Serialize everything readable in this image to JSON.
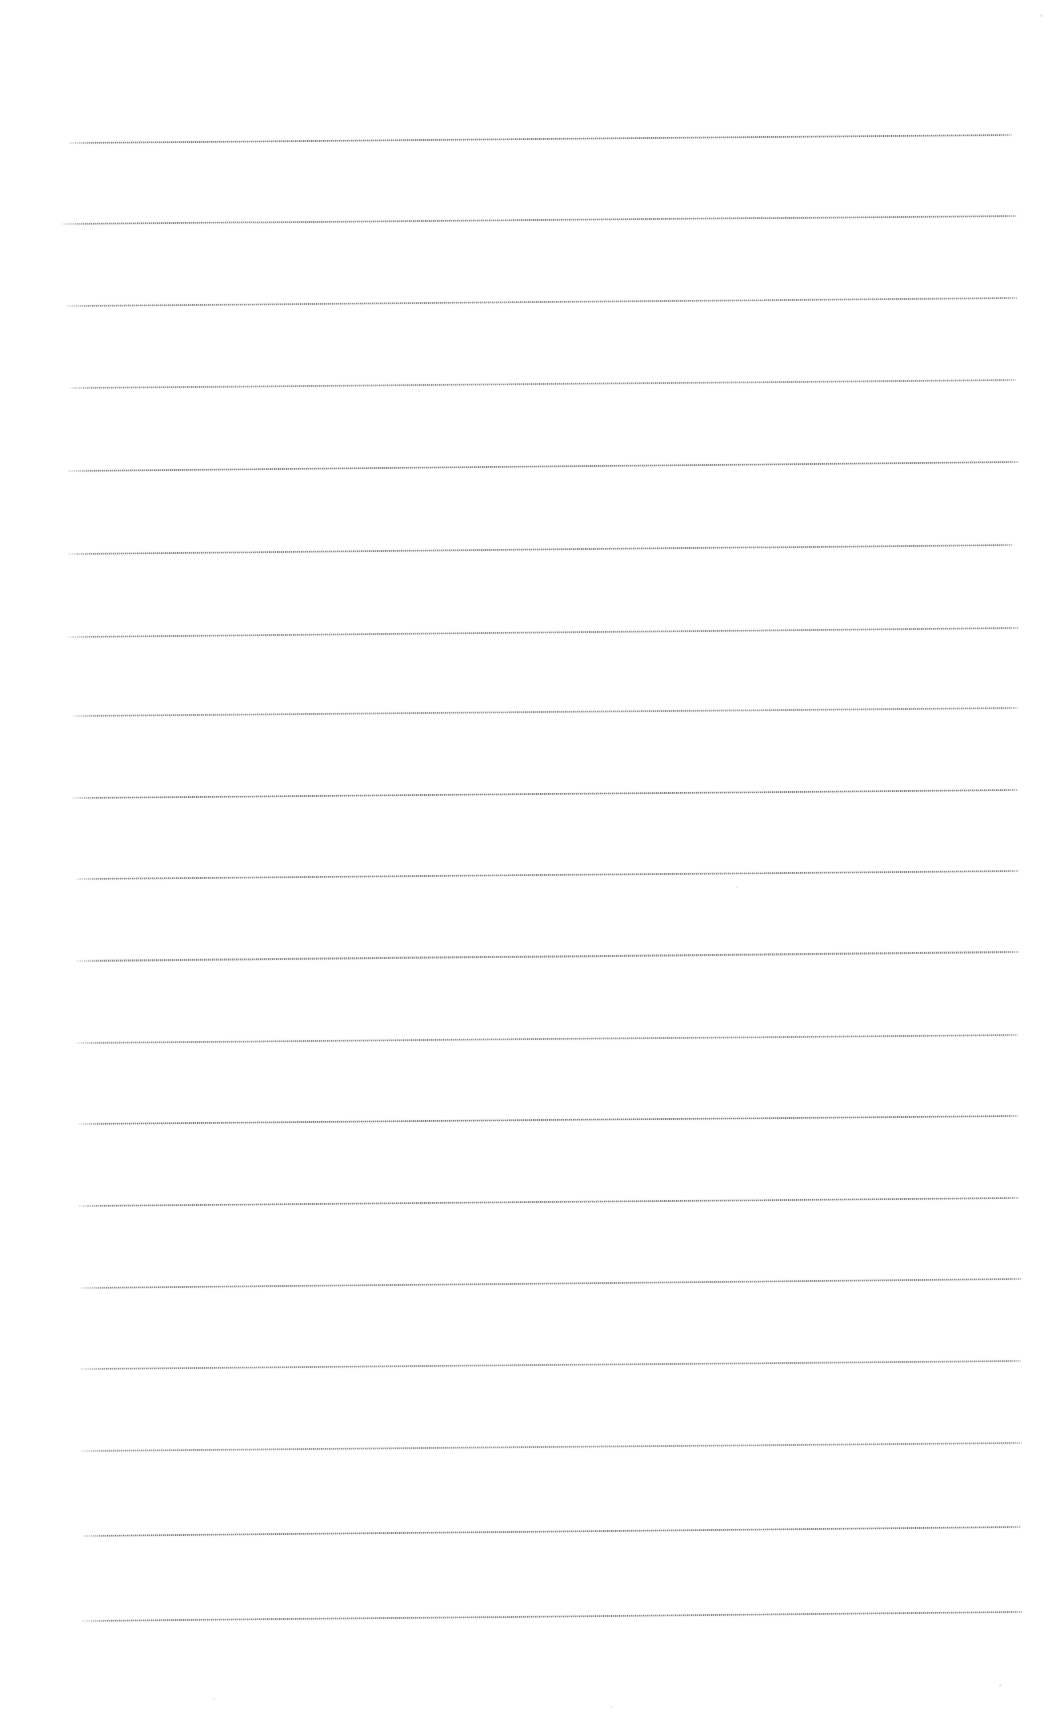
{
  "document": {
    "kind": "scanned-lined-paper",
    "title": "Blank ruled writing paper (scan)",
    "page_width": 1057,
    "page_height": 1724,
    "background_color": "#ffffff",
    "rule_color": "#6c7078",
    "rule_halo_color": "#b0b4bb",
    "content_text": "",
    "visible_text": "",
    "notes": "Page contains no printed characters, headings, numbers or marks — only horizontal ruled lines."
  },
  "ruling": {
    "line_count": 19,
    "line_spacing_px": 81.5,
    "first_line_y_px": 138,
    "last_line_y_px": 1620,
    "left_margin_px": 68,
    "right_margin_px": 1017,
    "line_length_px": 949,
    "skew_deg": -0.48,
    "stroke_thickness_px": 1.6,
    "orientation": "horizontal",
    "margin_rule": "none",
    "lines": [
      {
        "index": 1,
        "y_left": 142,
        "y_right": 134,
        "x_start": 68,
        "x_end": 1012
      },
      {
        "index": 2,
        "y_left": 223,
        "y_right": 215,
        "x_start": 62,
        "x_end": 1017
      },
      {
        "index": 3,
        "y_left": 305,
        "y_right": 297,
        "x_start": 66,
        "x_end": 1018
      },
      {
        "index": 4,
        "y_left": 387,
        "y_right": 379,
        "x_start": 69,
        "x_end": 1016
      },
      {
        "index": 5,
        "y_left": 470,
        "y_right": 461,
        "x_start": 68,
        "x_end": 1019
      },
      {
        "index": 6,
        "y_left": 553,
        "y_right": 544,
        "x_start": 68,
        "x_end": 1013
      },
      {
        "index": 7,
        "y_left": 636,
        "y_right": 627,
        "x_start": 68,
        "x_end": 1019
      },
      {
        "index": 8,
        "y_left": 715,
        "y_right": 707,
        "x_start": 72,
        "x_end": 1018
      },
      {
        "index": 9,
        "y_left": 797,
        "y_right": 789,
        "x_start": 72,
        "x_end": 1018
      },
      {
        "index": 10,
        "y_left": 878,
        "y_right": 870,
        "x_start": 76,
        "x_end": 1019
      },
      {
        "index": 11,
        "y_left": 960,
        "y_right": 951,
        "x_start": 76,
        "x_end": 1019
      },
      {
        "index": 12,
        "y_left": 1042,
        "y_right": 1034,
        "x_start": 76,
        "x_end": 1018
      },
      {
        "index": 13,
        "y_left": 1123,
        "y_right": 1115,
        "x_start": 78,
        "x_end": 1018
      },
      {
        "index": 14,
        "y_left": 1205,
        "y_right": 1197,
        "x_start": 78,
        "x_end": 1019
      },
      {
        "index": 15,
        "y_left": 1287,
        "y_right": 1278,
        "x_start": 80,
        "x_end": 1022
      },
      {
        "index": 16,
        "y_left": 1368,
        "y_right": 1360,
        "x_start": 80,
        "x_end": 1021
      },
      {
        "index": 17,
        "y_left": 1450,
        "y_right": 1442,
        "x_start": 80,
        "x_end": 1022
      },
      {
        "index": 18,
        "y_left": 1535,
        "y_right": 1526,
        "x_start": 82,
        "x_end": 1021
      },
      {
        "index": 19,
        "y_left": 1620,
        "y_right": 1611,
        "x_start": 82,
        "x_end": 1023
      }
    ]
  },
  "specks": [
    {
      "x": 1040,
      "y": 14,
      "size": 3
    },
    {
      "x": 418,
      "y": 390,
      "size": 2
    },
    {
      "x": 735,
      "y": 470,
      "size": 2
    },
    {
      "x": 736,
      "y": 886,
      "size": 2
    },
    {
      "x": 999,
      "y": 1684,
      "size": 3
    },
    {
      "x": 213,
      "y": 1698,
      "size": 2
    },
    {
      "x": 610,
      "y": 1706,
      "size": 2
    }
  ]
}
